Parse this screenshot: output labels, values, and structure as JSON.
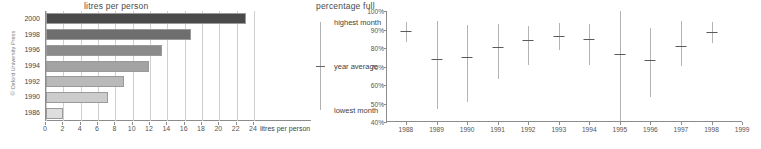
{
  "copyright": "© Oxford University Press",
  "chart_data": [
    {
      "id": "litres-per-person",
      "type": "bar",
      "orientation": "horizontal",
      "title": "litres per person",
      "xlabel": "24 litres per person",
      "ylabel": "",
      "axis_caption": "litres per person",
      "xlim": [
        0,
        24
      ],
      "ylim": null,
      "grid": "vertical",
      "legend": "none",
      "xticks": [
        "0",
        "2",
        "4",
        "6",
        "8",
        "10",
        "12",
        "14",
        "16",
        "18",
        "20",
        "22",
        "24"
      ],
      "categories": [
        "2000",
        "1998",
        "1996",
        "1994",
        "1992",
        "1990",
        "1986"
      ],
      "values": [
        23.1,
        16.7,
        13.4,
        11.9,
        9.0,
        7.2,
        2.0
      ],
      "colors": [
        "#4a4a4a",
        "#6e6e6e",
        "#8a8a8a",
        "#a3a3a3",
        "#b9b9b9",
        "#cccccc",
        "#dedede"
      ]
    },
    {
      "id": "percentage-full",
      "type": "range-with-marker",
      "title": "percentage full",
      "xlabel": "",
      "ylabel": "percentage full",
      "grid": "none",
      "legend_position": "left",
      "legend": [
        {
          "key": "highest",
          "label": "highest month"
        },
        {
          "key": "average",
          "label": "year average"
        },
        {
          "key": "lowest",
          "label": "lowest month"
        }
      ],
      "ylim": [
        40,
        100
      ],
      "yticks": [
        "40%",
        "50%",
        "60%",
        "70%",
        "80%",
        "90%",
        "100%"
      ],
      "categories": [
        "1988",
        "1989",
        "1990",
        "1991",
        "1992",
        "1993",
        "1994",
        "1995",
        "1996",
        "1997",
        "1998",
        "1999"
      ],
      "series": [
        {
          "name": "highest month",
          "values": [
            94.0,
            94.5,
            92.5,
            93.0,
            92.0,
            93.5,
            93.0,
            100.0,
            91.0,
            94.5,
            94.0,
            null
          ]
        },
        {
          "name": "year average",
          "values": [
            89.0,
            74.0,
            75.0,
            80.5,
            84.5,
            86.5,
            85.0,
            76.5,
            73.5,
            81.0,
            88.5,
            null
          ]
        },
        {
          "name": "lowest month",
          "values": [
            83.0,
            47.0,
            51.0,
            63.5,
            71.0,
            79.0,
            71.0,
            40.5,
            53.5,
            70.0,
            82.5,
            null
          ]
        }
      ],
      "range_color": "#b4b4b4",
      "marker_color": "#5a5a5a"
    }
  ]
}
